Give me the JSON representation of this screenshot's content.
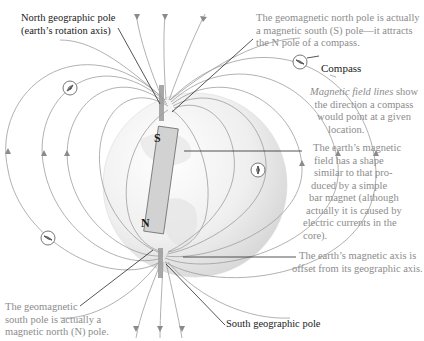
{
  "figure": {
    "bar_magnet": {
      "top_pole": "S",
      "bottom_pole": "N"
    },
    "labels": {
      "north_geo_pole": [
        "North geographic pole",
        "(earth’s rotation axis)"
      ],
      "geomag_north": [
        "The geomagnetic north pole is actually",
        "a magnetic south (S) pole—it attracts",
        "the N pole of a compass."
      ],
      "compass": "Compass",
      "field_lines_italic": "Magnetic field lines",
      "field_lines": [
        " show",
        "the direction a compass",
        "would point at a given",
        "location."
      ],
      "field_shape": [
        "The earth’s magnetic",
        "field has a shape",
        "similar to that pro-",
        "duced by a simple",
        "bar magnet (although",
        "actually it is caused by",
        "electric currents in the",
        "core)."
      ],
      "axis_offset": [
        "The earth’s magnetic axis is",
        "offset from its geographic axis."
      ],
      "south_geo_pole": "South geographic pole",
      "geomag_south": [
        "The geomagnetic",
        "south pole is actually a",
        "magnetic north (N) pole."
      ]
    },
    "colors": {
      "field_line": "#9a9a9a",
      "leader_line": "#2a2a2a",
      "globe_light": "#f4f4f4",
      "globe_dark": "#d6d6d6",
      "magnet_fill": "#d0d0d0",
      "dark_text": "#1a1a1a",
      "gray_text": "#8c8c8c"
    }
  }
}
